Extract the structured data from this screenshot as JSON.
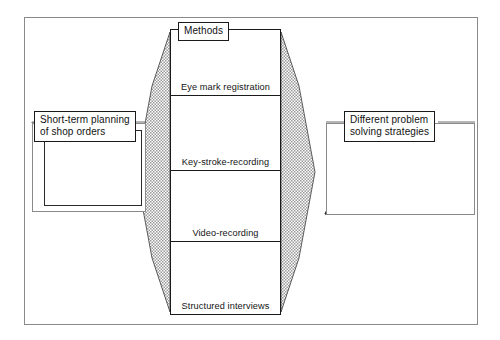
{
  "figure": {
    "title_hidden": "",
    "center_panel": {
      "header_label": "Methods",
      "methods": [
        {
          "label": "Eye mark registration",
          "icon": "eye-mark-registration-headset-icon"
        },
        {
          "label": "Key-stroke-recording",
          "icon": "keyboard-mouse-stopwatch-icon"
        },
        {
          "label": "Video-recording",
          "icon": "video-camera-tripod-icon"
        },
        {
          "label": "Structured interviews",
          "icon": "question-document-microphone-icon"
        }
      ]
    },
    "left_panel": {
      "label_line1": "Short-term planning",
      "label_line2": "of shop orders",
      "content_icon": "production-schedule-document-icon"
    },
    "right_panel": {
      "label_line1": "Different problem",
      "label_line2": "solving strategies",
      "computers": [
        {
          "name": "linear-strategy-computer",
          "diagram": "linear-flowchart"
        },
        {
          "name": "branching-strategy-computer",
          "diagram": "branching-flowchart"
        }
      ]
    },
    "connectors": [
      {
        "name": "left-funnel-wedge",
        "shading": "gray-hatch"
      },
      {
        "name": "right-funnel-wedge",
        "shading": "gray-hatch"
      }
    ],
    "colors": {
      "frame": "#8a8a8a",
      "ink": "#1a1a1a",
      "wedge_fill": "#b4b4b4",
      "paper": "#ffffff"
    }
  }
}
